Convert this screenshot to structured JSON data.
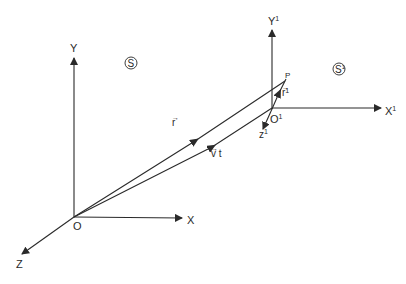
{
  "diagram": {
    "type": "reference-frames",
    "frame_S": {
      "symbol": "S",
      "origin_label": "O",
      "axes": {
        "x": "X",
        "y": "Y",
        "z": "Z"
      }
    },
    "frame_S_prime": {
      "symbol": "S",
      "symbol_superscript": "1",
      "origin_label": "O",
      "origin_superscript": "1",
      "axes": {
        "x": "X",
        "x_sup": "1",
        "y": "Y",
        "y_sup": "1",
        "z": "z",
        "z_sup": "1"
      }
    },
    "point_label": "P",
    "vectors": {
      "r": {
        "label": "r",
        "arrow": "→"
      },
      "r_prime": {
        "label": "r",
        "arrow": "→",
        "superscript": "1"
      },
      "vt": {
        "label": "v t",
        "arrow": "→"
      }
    }
  }
}
